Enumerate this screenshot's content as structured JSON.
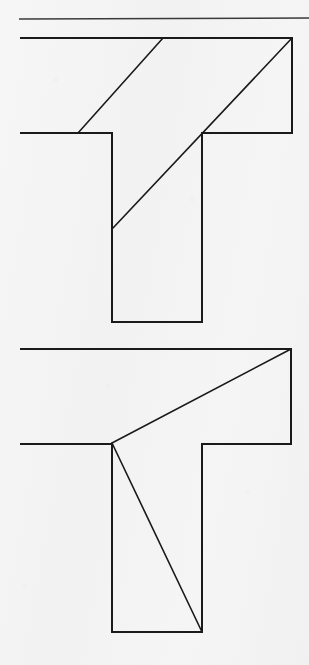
{
  "page": {
    "title": "Geometric dissection puzzle: two T-shaped figures",
    "background_color": "#f4f4f4",
    "ink_color": "#1a1a1a",
    "width": 309,
    "height": 665
  },
  "rule": {
    "name": "top-horizontal-rule",
    "x1": 19,
    "y1": 19,
    "x2": 309,
    "y2": 18,
    "stroke_width": 1.4,
    "color": "#3a3a3a"
  },
  "figures": [
    {
      "id": "figure-top",
      "label": "Upper T-shape with two parallel diagonal cut lines",
      "outline": {
        "name": "t-outline-top",
        "points": "21,38 292,38 292,133 202,133 202,322 112,322 112,133 21,133",
        "stroke_width": 2.0,
        "fill": "none"
      },
      "cuts": [
        {
          "name": "cut-line-top-short-diagonal",
          "x1": 78,
          "y1": 133,
          "x2": 163,
          "y2": 38,
          "stroke_width": 1.6
        },
        {
          "name": "cut-line-top-long-diagonal",
          "x1": 113,
          "y1": 228,
          "x2": 292,
          "y2": 38,
          "stroke_width": 1.6
        }
      ]
    },
    {
      "id": "figure-bottom",
      "label": "Lower T-shape with two diagonal cut lines meeting at a vertex",
      "outline": {
        "name": "t-outline-bottom",
        "points": "21,349 291,349 291,444 202,444 202,632 112,632 112,444 21,444",
        "stroke_width": 2.0,
        "fill": "none"
      },
      "cuts": [
        {
          "name": "cut-line-bottom-upper-diagonal",
          "x1": 112,
          "y1": 443,
          "x2": 291,
          "y2": 349,
          "stroke_width": 1.6
        },
        {
          "name": "cut-line-bottom-lower-diagonal",
          "x1": 112,
          "y1": 443,
          "x2": 202,
          "y2": 632,
          "stroke_width": 1.6
        }
      ]
    }
  ]
}
